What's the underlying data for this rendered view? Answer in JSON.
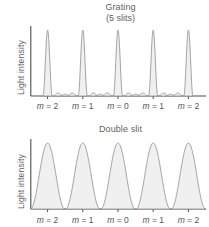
{
  "figure": {
    "background_color": "#ffffff",
    "curve_stroke_color": "#9a9a9a",
    "curve_fill_color": "#f0f0f0",
    "axis_color": "#4d4d4d",
    "text_color": "#5f5f5f"
  },
  "panels": {
    "grating": {
      "title": "Grating",
      "subtitle": "(5 slits)",
      "ylabel": "Light intensity",
      "order_labels": [
        "m = 2",
        "m = 1",
        "m = 0",
        "m = 1",
        "m = 2"
      ]
    },
    "double_slit": {
      "title": "Double slit",
      "ylabel": "Light intensity",
      "order_labels": [
        "m = 2",
        "m = 1",
        "m = 0",
        "m = 1",
        "m = 2"
      ]
    }
  },
  "chart_data": [
    {
      "type": "line",
      "title": "Grating",
      "subtitle": "(5 slits)",
      "xlabel": "",
      "ylabel": "Light intensity",
      "grid": false,
      "legend": null,
      "xlim": [
        -2.5,
        2.5
      ],
      "ylim": [
        0,
        1
      ],
      "xticks": [
        -2,
        -1,
        0,
        1,
        2
      ],
      "xticklabels": [
        "m = 2",
        "m = 1",
        "m = 0",
        "m = 1",
        "m = 2"
      ],
      "yticks": [],
      "yticklabels": [],
      "description": "Five-slit grating intensity pattern: narrow principal maxima of equal height at m = -2,-1,0,1,2 with three weak secondary maxima between consecutive principal maxima.",
      "slits": 5,
      "principal_maxima": {
        "x": [
          -2,
          -1,
          0,
          1,
          2
        ],
        "height": [
          1.0,
          1.0,
          1.0,
          1.0,
          1.0
        ],
        "half_width": 0.09
      },
      "secondary_maxima": {
        "offsets_between_orders": [
          0.3,
          0.5,
          0.7
        ],
        "height": [
          0.045,
          0.028,
          0.045
        ]
      }
    },
    {
      "type": "line",
      "title": "Double slit",
      "subtitle": "",
      "xlabel": "",
      "ylabel": "Light intensity",
      "grid": false,
      "legend": null,
      "xlim": [
        -2.5,
        2.5
      ],
      "ylim": [
        0,
        1
      ],
      "xticks": [
        -2,
        -1,
        0,
        1,
        2
      ],
      "xticklabels": [
        "m = 2",
        "m = 1",
        "m = 0",
        "m = 1",
        "m = 2"
      ],
      "yticks": [],
      "yticklabels": [],
      "description": "Double-slit intensity pattern: broad cosine-squared fringes of equal height centred at m = -2,-1,0,1,2 falling to zero midway between orders.",
      "slits": 2,
      "maxima": {
        "x": [
          -2,
          -1,
          0,
          1,
          2
        ],
        "height": [
          1.0,
          1.0,
          1.0,
          1.0,
          1.0
        ],
        "half_width": 0.5
      }
    }
  ]
}
